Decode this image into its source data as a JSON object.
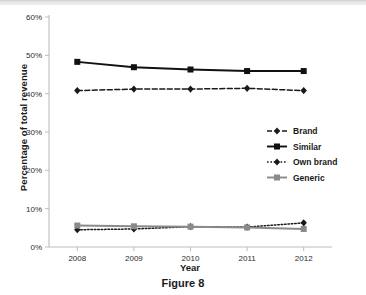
{
  "figure": {
    "caption": "Figure 8"
  },
  "chart_data": {
    "type": "line",
    "title": "",
    "xlabel": "Year",
    "ylabel": "Percentage of total revenue",
    "categories": [
      "2008",
      "2009",
      "2010",
      "2011",
      "2012"
    ],
    "x": [
      2008,
      2009,
      2010,
      2011,
      2012
    ],
    "ylim": [
      0,
      60
    ],
    "ytick_values": [
      0,
      10,
      20,
      30,
      40,
      50,
      60
    ],
    "ytick_labels": [
      "0%",
      "10%",
      "20%",
      "30%",
      "40%",
      "50%",
      "60%"
    ],
    "grid": false,
    "legend_position": "center-right",
    "series": [
      {
        "name": "Brand",
        "values": [
          40.8,
          41.2,
          41.2,
          41.4,
          40.8
        ],
        "color": "#1a1a1a",
        "linestyle": "dashed",
        "marker": "diamond"
      },
      {
        "name": "Similar",
        "values": [
          48.3,
          46.9,
          46.3,
          45.9,
          45.9
        ],
        "color": "#111111",
        "linestyle": "solid",
        "marker": "square"
      },
      {
        "name": "Own brand",
        "values": [
          4.5,
          4.7,
          5.3,
          5.2,
          6.3
        ],
        "color": "#1a1a1a",
        "linestyle": "dotted",
        "marker": "diamond"
      },
      {
        "name": "Generic",
        "values": [
          5.6,
          5.4,
          5.3,
          5.1,
          4.7
        ],
        "color": "#8a8a8a",
        "linestyle": "solid",
        "marker": "square"
      }
    ]
  },
  "axis": {
    "axis_color": "#bdbdbd"
  }
}
